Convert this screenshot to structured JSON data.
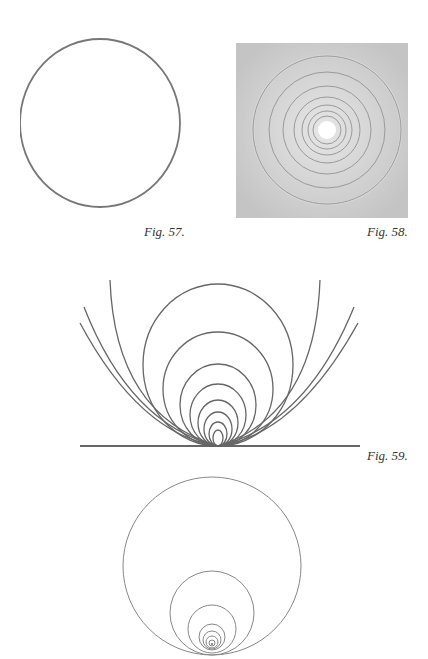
{
  "page": {
    "figures": [
      {
        "id": "fig57",
        "caption": "Fig. 57.",
        "description": "single hand-drawn circle"
      },
      {
        "id": "fig58",
        "caption": "Fig. 58.",
        "description": "shaded square with concentric circles around a white center"
      },
      {
        "id": "fig59",
        "caption": "Fig. 59.",
        "description": "nested circles tangent to a baseline at one point, with outer arcs opening outward"
      },
      {
        "id": "fig60",
        "caption": "",
        "description": "large circle with smaller nested circles internally tangent near the bottom"
      }
    ]
  },
  "colors": {
    "line": "#6f6f6f",
    "shade": "#c9c9c9",
    "caption": "#333333"
  }
}
